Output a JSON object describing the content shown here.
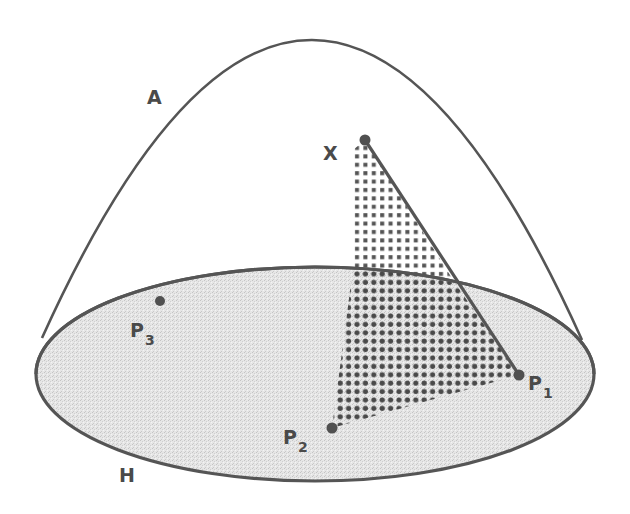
{
  "diagram": {
    "colors": {
      "stroke": "#555555",
      "ellipse_fill": "#e2e2e2",
      "dot_color": "#5a5a5a",
      "background": "#ffffff"
    },
    "labels": {
      "surface": "A",
      "plane": "H",
      "apex": "X",
      "p1_main": "P",
      "p1_sub": "1",
      "p2_main": "P",
      "p2_sub": "2",
      "p3_main": "P",
      "p3_sub": "3"
    },
    "points": {
      "X": [
        365,
        140
      ],
      "P1": [
        519,
        375
      ],
      "P2": [
        332,
        428
      ],
      "P3": [
        160,
        301
      ]
    }
  }
}
